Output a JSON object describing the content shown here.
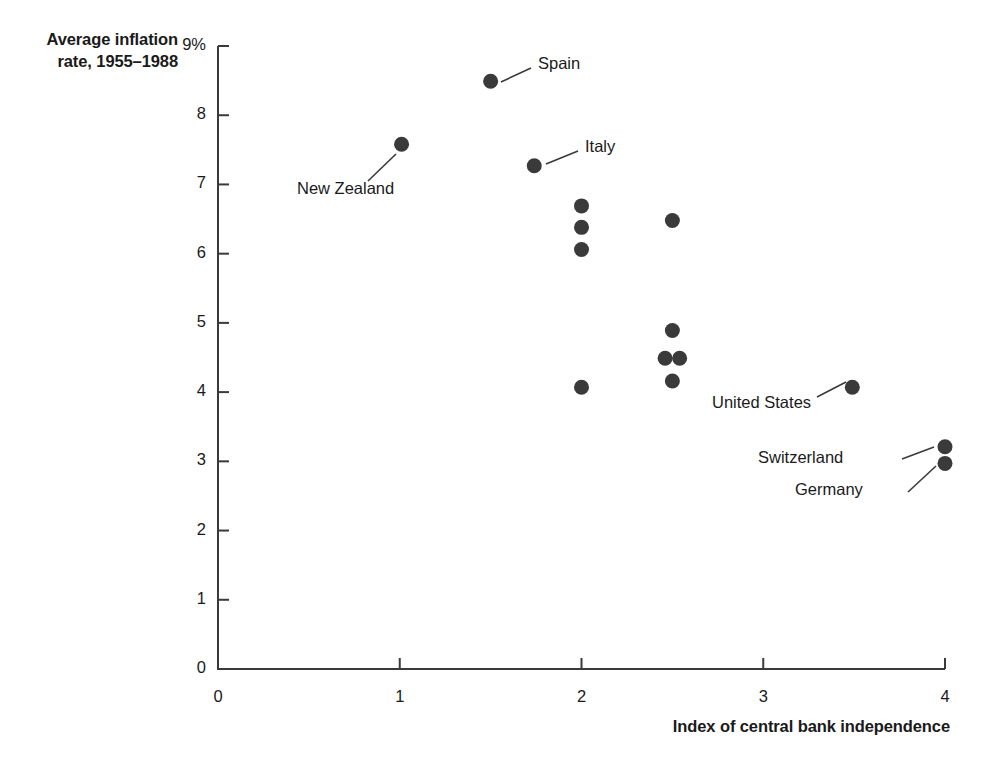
{
  "chart_data": {
    "type": "scatter",
    "title": "",
    "ylabel": "Average inflation\nrate, 1955–1988",
    "xlabel": "Index of central bank independence",
    "xlim": [
      0,
      4
    ],
    "ylim": [
      0,
      9
    ],
    "grid": false,
    "legend": "none",
    "x_ticks": [
      "0",
      "1",
      "2",
      "3",
      "4"
    ],
    "x_tick_values": [
      0,
      1,
      2,
      3,
      4
    ],
    "y_ticks": [
      "0",
      "1",
      "2",
      "3",
      "4",
      "5",
      "6",
      "7",
      "8",
      "9%"
    ],
    "y_tick_values": [
      0,
      1,
      2,
      3,
      4,
      5,
      6,
      7,
      8,
      9
    ],
    "marker_color": "#3a3a3a",
    "points": [
      {
        "label": "New Zealand",
        "x": 1.01,
        "y": 7.58
      },
      {
        "label": "Spain",
        "x": 1.5,
        "y": 8.49
      },
      {
        "label": "Italy",
        "x": 1.74,
        "y": 7.27
      },
      {
        "label": "",
        "x": 2.0,
        "y": 6.69
      },
      {
        "label": "",
        "x": 2.0,
        "y": 6.38
      },
      {
        "label": "",
        "x": 2.0,
        "y": 6.06
      },
      {
        "label": "",
        "x": 2.0,
        "y": 4.07
      },
      {
        "label": "",
        "x": 2.5,
        "y": 6.48
      },
      {
        "label": "",
        "x": 2.5,
        "y": 4.89
      },
      {
        "label": "",
        "x": 2.46,
        "y": 4.49
      },
      {
        "label": "",
        "x": 2.54,
        "y": 4.49
      },
      {
        "label": "",
        "x": 2.5,
        "y": 4.16
      },
      {
        "label": "United States",
        "x": 3.49,
        "y": 4.07
      },
      {
        "label": "Switzerland",
        "x": 4.0,
        "y": 3.21
      },
      {
        "label": "Germany",
        "x": 4.0,
        "y": 2.97
      }
    ],
    "annotations": [
      {
        "text": "Spain",
        "text_x": 538,
        "text_y": 71,
        "leader_from": [
          531,
          68
        ],
        "leader_to": [
          501,
          82
        ]
      },
      {
        "text": "Italy",
        "text_x": 585,
        "text_y": 154,
        "leader_from": [
          578,
          151
        ],
        "leader_to": [
          546,
          164
        ]
      },
      {
        "text": "New Zealand",
        "text_x": 297,
        "text_y": 196,
        "leader_from": [
          368,
          181
        ],
        "leader_to": [
          396,
          154
        ]
      },
      {
        "text": "United States",
        "text_x": 712,
        "text_y": 410,
        "leader_from": [
          817,
          397
        ],
        "leader_to": [
          846,
          382
        ]
      },
      {
        "text": "Switzerland",
        "text_x": 758,
        "text_y": 465,
        "leader_from": [
          902,
          459
        ],
        "leader_to": [
          934,
          447
        ]
      },
      {
        "text": "Germany",
        "text_x": 795,
        "text_y": 497,
        "leader_from": [
          908,
          492
        ],
        "leader_to": [
          936,
          466
        ]
      }
    ]
  },
  "axis_geometry": {
    "left_px": 218,
    "right_px": 945,
    "bottom_px": 669,
    "top_px": 46
  }
}
